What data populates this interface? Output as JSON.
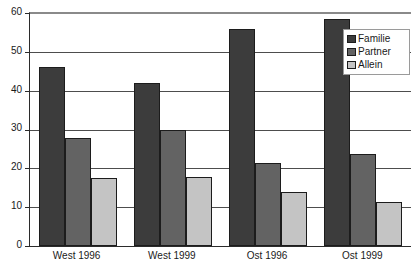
{
  "chart_data": {
    "type": "bar",
    "title": "",
    "subtitle": "",
    "xlabel": "",
    "ylabel": "",
    "ylim": [
      0,
      60
    ],
    "yticks": [
      0,
      10,
      20,
      30,
      40,
      50,
      60
    ],
    "grid": true,
    "legend_position": "top-right",
    "categories": [
      "West 1996",
      "West 1999",
      "Ost 1996",
      "Ost 1999"
    ],
    "series": [
      {
        "name": "Familie",
        "color": "#3c3c3c",
        "values": [
          46,
          42,
          56,
          58.5
        ]
      },
      {
        "name": "Partner",
        "color": "#636363",
        "values": [
          27.8,
          30,
          21.3,
          23.6
        ]
      },
      {
        "name": "Allein",
        "color": "#c4c4c4",
        "values": [
          17.5,
          17.7,
          14,
          11.4
        ]
      }
    ]
  },
  "axes": {
    "y_tick_labels": [
      "60",
      "50",
      "40",
      "30",
      "20",
      "10",
      "0"
    ],
    "x_tick_labels": [
      "West 1996",
      "West 1999",
      "Ost 1996",
      "Ost 1999"
    ]
  },
  "legend": {
    "entries": [
      {
        "label": "Familie"
      },
      {
        "label": "Partner"
      },
      {
        "label": "Allein"
      }
    ]
  },
  "colors": {
    "series_familie": "#3c3c3c",
    "series_partner": "#636363",
    "series_allein": "#c4c4c4",
    "axis": "#2b2b2b",
    "gridline": "#4d4d4d",
    "background": "#ffffff"
  }
}
